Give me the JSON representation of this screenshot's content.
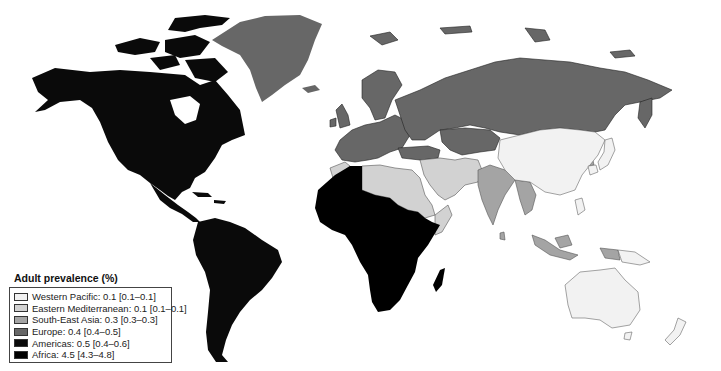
{
  "legend": {
    "title": "Adult prevalence (%)",
    "items": [
      {
        "region": "Western Pacific",
        "label": "Western Pacific: 0.1 [0.1–0.1]",
        "value": 0.1,
        "range": [
          0.1,
          0.1
        ],
        "color": "#f2f2f2"
      },
      {
        "region": "Eastern Mediterranean",
        "label": "Eastern Mediterranean: 0.1 [0.1–0.1]",
        "value": 0.1,
        "range": [
          0.1,
          0.1
        ],
        "color": "#d2d2d2"
      },
      {
        "region": "South-East Asia",
        "label": "South-East Asia: 0.3 [0.3–0.3]",
        "value": 0.3,
        "range": [
          0.3,
          0.3
        ],
        "color": "#a4a4a4"
      },
      {
        "region": "Europe",
        "label": "Europe: 0.4 [0.4–0.5]",
        "value": 0.4,
        "range": [
          0.4,
          0.5
        ],
        "color": "#676767"
      },
      {
        "region": "Americas",
        "label": "Americas: 0.5 [0.4–0.6]",
        "value": 0.5,
        "range": [
          0.4,
          0.6
        ],
        "color": "#0a0a0a"
      },
      {
        "region": "Africa",
        "label": "Africa: 4.5 [4.3–4.8]",
        "value": 4.5,
        "range": [
          4.3,
          4.8
        ],
        "color": "#000000"
      }
    ]
  },
  "colors": {
    "western_pacific": "#f2f2f2",
    "eastern_mediterranean": "#d2d2d2",
    "south_east_asia": "#a4a4a4",
    "europe": "#676767",
    "americas": "#0a0a0a",
    "africa": "#000000",
    "border": "#555555"
  }
}
